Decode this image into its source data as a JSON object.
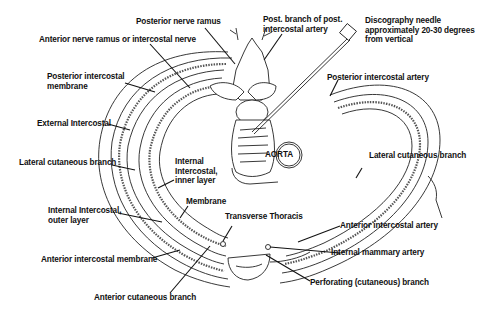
{
  "diagram": {
    "labels": {
      "posterior_nerve_ramus": "Posterior nerve ramus",
      "anterior_nerve_ramus": "Anterior nerve ramus or intercostal nerve",
      "post_branch_artery": "Post. branch of post.\nintercostal artery",
      "discography_needle": "Discography needle\napproximately 20-30 degrees\nfrom vertical",
      "posterior_intercostal_membrane": "Posterior intercostal\nmembrane",
      "posterior_intercostal_artery": "Posterior intercostal artery",
      "external_intercostal": "External Intercostal",
      "lateral_cutaneous_branch_left": "Lateral cutaneous branch",
      "internal_intercostal_inner": "Internal\nIntercostal,\ninner layer",
      "aorta": "AORTA",
      "lateral_cutaneous_branch_right": "Lateral cutaneous branch",
      "membrane": "Membrane",
      "internal_intercostal_outer": "Internal Intercostal,\nouter layer",
      "transverse_thoracis": "Transverse Thoracis",
      "anterior_intercostal_artery": "Anterior intercostal artery",
      "anterior_intercostal_membrane": "Anterior intercostal membrane",
      "internal_mammary_artery": "Internal mammary artery",
      "perforating_branch": "Perforating (cutaneous) branch",
      "anterior_cutaneous_branch": "Anterior cutaneous branch"
    }
  }
}
